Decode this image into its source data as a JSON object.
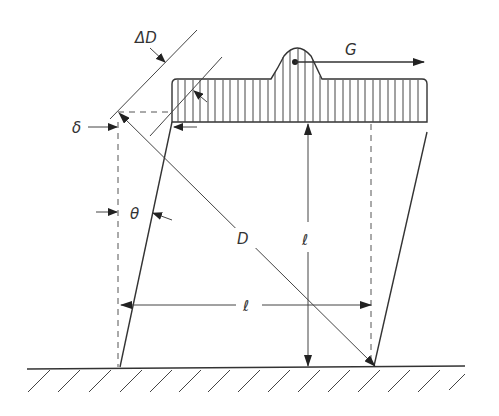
{
  "diagram": {
    "type": "shear deformation of a block (simple shear schematic)",
    "labels": {
      "delta_D": "ΔD",
      "delta": "δ",
      "theta": "θ",
      "D": "D",
      "ell_vertical": "ℓ",
      "ell_horizontal": "ℓ",
      "G": "G"
    },
    "elements": [
      "ground with hatching",
      "sheared parallelogram body",
      "hatched top shear plate with bump",
      "force arrow G",
      "diagonal D",
      "dimension ℓ vertical",
      "dimension ℓ horizontal",
      "displacement δ",
      "angle θ",
      "elongation ΔD"
    ],
    "colors": {
      "ink": "#333333",
      "background": "#ffffff"
    }
  }
}
